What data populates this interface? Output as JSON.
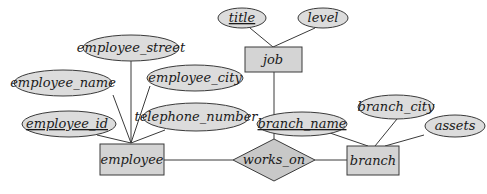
{
  "diagram": {
    "type": "ER diagram",
    "entities": [
      {
        "id": "employee",
        "label": "employee"
      },
      {
        "id": "job",
        "label": "job"
      },
      {
        "id": "branch",
        "label": "branch"
      }
    ],
    "relationships": [
      {
        "id": "works_on",
        "label": "works_on",
        "connects": [
          "employee",
          "job",
          "branch"
        ]
      }
    ],
    "attributes": {
      "employee_street": {
        "label": "employee_street",
        "entity": "employee",
        "key": false
      },
      "employee_name": {
        "label": "employee_name",
        "entity": "employee",
        "key": false
      },
      "employee_city": {
        "label": "employee_city",
        "entity": "employee",
        "key": false
      },
      "employee_id": {
        "label": "employee_id",
        "entity": "employee",
        "key": true
      },
      "telephone_number": {
        "label": "telephone_number",
        "entity": "employee",
        "key": false
      },
      "title": {
        "label": "title",
        "entity": "job",
        "key": true
      },
      "level": {
        "label": "level",
        "entity": "job",
        "key": false
      },
      "branch_name": {
        "label": "branch_name",
        "entity": "branch",
        "key": true
      },
      "branch_city": {
        "label": "branch_city",
        "entity": "branch",
        "key": false
      },
      "assets": {
        "label": "assets",
        "entity": "branch",
        "key": false
      }
    },
    "labels": {
      "employee": "employee",
      "job": "job",
      "branch": "branch",
      "works_on": "works_on"
    }
  }
}
